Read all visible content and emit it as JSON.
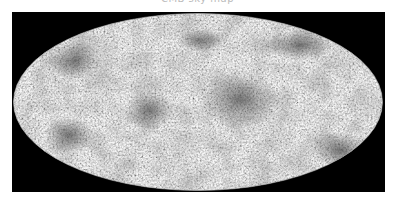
{
  "figure": {
    "title": "CMB sky map",
    "projection": "Mollweide (all-sky ellipse)",
    "colormap": "grayscale",
    "background_color": "#000000",
    "map_base_color": "#c8c8c8",
    "dark_region_color": "#555555"
  },
  "dark_regions": [
    {
      "name": "center-cold-region",
      "cx": 240,
      "cy": 100,
      "rx": 40,
      "ry": 28
    },
    {
      "name": "lower-right-region",
      "cx": 340,
      "cy": 150,
      "rx": 30,
      "ry": 18
    },
    {
      "name": "upper-left-region",
      "cx": 75,
      "cy": 60,
      "rx": 28,
      "ry": 20
    },
    {
      "name": "upper-right-region",
      "cx": 300,
      "cy": 45,
      "rx": 35,
      "ry": 15
    },
    {
      "name": "lower-left-region",
      "cx": 70,
      "cy": 135,
      "rx": 25,
      "ry": 18
    },
    {
      "name": "mid-left-region",
      "cx": 150,
      "cy": 110,
      "rx": 25,
      "ry": 20
    },
    {
      "name": "upper-mid-region",
      "cx": 200,
      "cy": 40,
      "rx": 22,
      "ry": 12
    }
  ]
}
